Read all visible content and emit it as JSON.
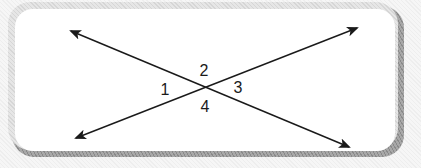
{
  "figure": {
    "type": "intersecting-lines",
    "colors": {
      "background": "#ffffff",
      "line": "#1a1a1a",
      "frame_light": "#e0e0e0",
      "frame_shadow": "#999999"
    },
    "lines": [
      {
        "name": "line-a",
        "from": [
          71,
          31
        ],
        "to": [
          349,
          147
        ]
      },
      {
        "name": "line-b",
        "from": [
          76,
          138
        ],
        "to": [
          357,
          28
        ]
      }
    ],
    "intersection": [
      207,
      87
    ],
    "angles": [
      {
        "label": "1",
        "x": 165,
        "y": 95
      },
      {
        "label": "2",
        "x": 204,
        "y": 76
      },
      {
        "label": "3",
        "x": 238,
        "y": 93
      },
      {
        "label": "4",
        "x": 205,
        "y": 112
      }
    ]
  }
}
